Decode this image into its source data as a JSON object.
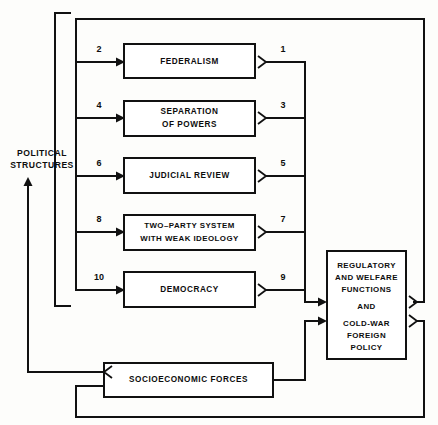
{
  "diagram": {
    "side_label": {
      "line1": "POLITICAL",
      "line2": "STRUCTURES"
    },
    "structure_boxes": [
      {
        "id": "federalism",
        "lines": [
          "FEDERALISM"
        ],
        "in_number": "2",
        "out_number": "1"
      },
      {
        "id": "separation",
        "lines": [
          "SEPARATION",
          "OF POWERS"
        ],
        "in_number": "4",
        "out_number": "3"
      },
      {
        "id": "judicial-review",
        "lines": [
          "JUDICIAL REVIEW"
        ],
        "in_number": "6",
        "out_number": "5"
      },
      {
        "id": "two-party",
        "lines": [
          "TWO–PARTY SYSTEM",
          "WITH WEAK IDEOLOGY"
        ],
        "in_number": "8",
        "out_number": "7"
      },
      {
        "id": "democracy",
        "lines": [
          "DEMOCRACY"
        ],
        "in_number": "10",
        "out_number": "9"
      }
    ],
    "outcome_box": {
      "id": "regulatory-welfare-coldwar",
      "lines": [
        "REGULATORY",
        "AND WELFARE",
        "FUNCTIONS",
        "AND",
        "COLD-WAR",
        "FOREIGN",
        "POLICY"
      ]
    },
    "forces_box": {
      "id": "socioeconomic-forces",
      "lines": [
        "SOCIOECONOMIC FORCES"
      ]
    },
    "colors": {
      "ink": "#111111",
      "paper": "#fdfdfb",
      "box_fill": "#ffffff"
    }
  }
}
